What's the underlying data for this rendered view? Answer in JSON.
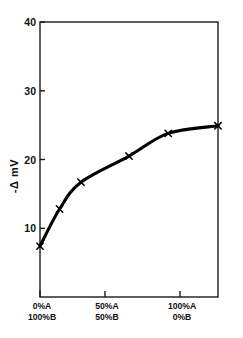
{
  "chart_data": {
    "type": "line",
    "title": "",
    "subtitle": "",
    "xlabel": "",
    "ylabel": "-Δ mV",
    "ylabel_parts": [
      "-",
      "Δ",
      "m",
      "V"
    ],
    "xlim": [
      0,
      100
    ],
    "ylim": [
      0,
      40
    ],
    "grid": false,
    "legend": null,
    "marker": "x",
    "line_color": "#000000",
    "marker_color": "#000000",
    "yticks": [
      10,
      20,
      30,
      40
    ],
    "ytick_labels": [
      "10",
      "20",
      "30",
      "40"
    ],
    "xticks": [
      0,
      50,
      100
    ],
    "xtick_labels": [
      {
        "top": "0%A",
        "bottom": "100%B"
      },
      {
        "top": "50%A",
        "bottom": "50%B"
      },
      {
        "top": "100%A",
        "bottom": "0%B"
      }
    ],
    "x": [
      0,
      11,
      23,
      50,
      72,
      100
    ],
    "values": [
      7.4,
      12.8,
      16.7,
      20.5,
      23.8,
      24.9
    ],
    "series": [
      {
        "name": "-Δ mV vs composition",
        "x": [
          0,
          11,
          23,
          50,
          72,
          100
        ],
        "values": [
          7.4,
          12.8,
          16.7,
          20.5,
          23.8,
          24.9
        ]
      }
    ]
  },
  "figure": {
    "background_color": "#ffffff",
    "axis_color": "#000000"
  }
}
